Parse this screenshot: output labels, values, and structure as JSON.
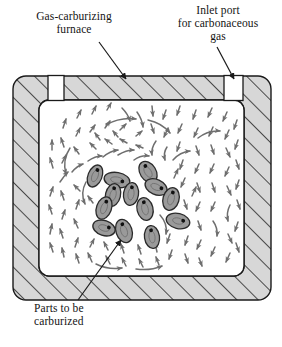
{
  "figure": {
    "background_color": "#ffffff"
  },
  "callouts": [
    {
      "name": "gas-carburizing-furnace",
      "text": "Gas-carburizing\nfurnace",
      "points_to": "furnace-wall"
    },
    {
      "name": "inlet-port-for-carbonaceous-gas",
      "text": "Inlet port\nfor carbonaceous\ngas",
      "points_to": "inlet-port-right"
    },
    {
      "name": "parts-to-be-carburized",
      "text": "Parts to be\ncarburized",
      "points_to": "parts-cluster"
    }
  ],
  "furnace": {
    "wall_fill": "#d7d7d7",
    "wall_stroke": "#1a1a1a",
    "hatch_stroke": "#1a1a1a",
    "chamber_fill": "#ffffff",
    "outer": {
      "x": 13,
      "y": 76,
      "width": 258,
      "height": 224,
      "radius": 13
    },
    "inner": {
      "x": 39,
      "y": 100,
      "width": 205,
      "height": 176,
      "radius": 10
    },
    "ports": [
      {
        "name": "inlet-port-left",
        "x": 48,
        "y": 76,
        "width": 16,
        "height": 24
      },
      {
        "name": "inlet-port-right",
        "x": 224,
        "y": 76,
        "width": 19,
        "height": 24
      }
    ]
  },
  "parts": {
    "name": "parts-to-be-carburized",
    "count": 13,
    "fill": "#9a9a9a",
    "stroke": "#2a2a2a",
    "dot_color": "#111111",
    "items": [
      {
        "cx": 95,
        "cy": 176,
        "rx": 7,
        "ry": 11.5,
        "angle": 22
      },
      {
        "cx": 117,
        "cy": 180,
        "rx": 13,
        "ry": 7.5,
        "angle": 10
      },
      {
        "cx": 148,
        "cy": 172,
        "rx": 8,
        "ry": 11.5,
        "angle": -32
      },
      {
        "cx": 156,
        "cy": 187,
        "rx": 11.5,
        "ry": 7.5,
        "angle": 24
      },
      {
        "cx": 113,
        "cy": 195,
        "rx": 7.5,
        "ry": 11.5,
        "angle": 14
      },
      {
        "cx": 131,
        "cy": 194,
        "rx": 7.5,
        "ry": 11.5,
        "angle": 8
      },
      {
        "cx": 104,
        "cy": 208,
        "rx": 7.5,
        "ry": 11.5,
        "angle": 20
      },
      {
        "cx": 145,
        "cy": 209,
        "rx": 8,
        "ry": 11.5,
        "angle": -14
      },
      {
        "cx": 171,
        "cy": 199,
        "rx": 8,
        "ry": 11.5,
        "angle": 16
      },
      {
        "cx": 104,
        "cy": 228,
        "rx": 11.5,
        "ry": 7.5,
        "angle": 18
      },
      {
        "cx": 124,
        "cy": 231,
        "rx": 8,
        "ry": 12,
        "angle": -18
      },
      {
        "cx": 178,
        "cy": 221,
        "rx": 12,
        "ry": 7.5,
        "angle": 14
      },
      {
        "cx": 152,
        "cy": 237,
        "rx": 7.5,
        "ry": 11.5,
        "angle": -8
      }
    ]
  },
  "gas_flow": {
    "name": "gas-flow-arrows",
    "color": "#6e6e6e",
    "description": "swirling arrow field filling the furnace chamber"
  },
  "leader_lines": {
    "color": "#1a1a1a",
    "furnace": {
      "x1": 99,
      "y1": 42,
      "x2": 126,
      "y2": 79
    },
    "inlet": {
      "x1": 217,
      "y1": 47,
      "x2": 234,
      "y2": 79
    },
    "parts": {
      "x1": 78,
      "y1": 300,
      "x2": 121,
      "y2": 240
    }
  }
}
